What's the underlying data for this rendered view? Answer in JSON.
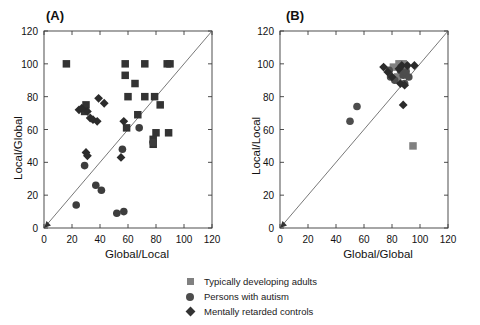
{
  "figure": {
    "width": 480,
    "height": 325,
    "background": "#ffffff"
  },
  "panels": [
    {
      "id": "A",
      "label": "(A)",
      "xlabel": "Global/Local",
      "ylabel": "Local/Global",
      "xlim": [
        0,
        120
      ],
      "ylim": [
        0,
        120
      ],
      "xticks": [
        0,
        20,
        40,
        60,
        80,
        100,
        120
      ],
      "yticks": [
        0,
        20,
        40,
        60,
        80,
        100,
        120
      ],
      "identity_line": true
    },
    {
      "id": "B",
      "label": "(B)",
      "xlabel": "Global/Global",
      "ylabel": "Local/Local",
      "xlim": [
        0,
        120
      ],
      "ylim": [
        0,
        120
      ],
      "xticks": [
        0,
        20,
        40,
        60,
        80,
        100,
        120
      ],
      "yticks": [
        0,
        20,
        40,
        60,
        80,
        100,
        120
      ],
      "identity_line": true
    }
  ],
  "legend": {
    "items": [
      {
        "marker": "square",
        "shape_icon": "square-marker-icon",
        "label": "Typically developing adults",
        "color": "#808080"
      },
      {
        "marker": "circle",
        "shape_icon": "circle-marker-icon",
        "label": "Persons with autism",
        "color": "#4d4d4d"
      },
      {
        "marker": "diamond",
        "shape_icon": "diamond-marker-icon",
        "label": "Mentally retarded controls",
        "color": "#333333"
      }
    ]
  },
  "chart_data": [
    {
      "type": "scatter",
      "panel": "A",
      "title": "(A)",
      "xlabel": "Global/Local",
      "ylabel": "Local/Global",
      "xlim": [
        0,
        120
      ],
      "ylim": [
        0,
        120
      ],
      "xticks": [
        0,
        20,
        40,
        60,
        80,
        100,
        120
      ],
      "yticks": [
        0,
        20,
        40,
        60,
        80,
        100,
        120
      ],
      "grid": false,
      "legend_position": "below-figure",
      "reference_line": {
        "type": "identity",
        "from": [
          0,
          0
        ],
        "to": [
          120,
          120
        ]
      },
      "series": [
        {
          "name": "Typically developing adults",
          "marker": "square",
          "color": "#333333",
          "points": [
            [
              16,
              100
            ],
            [
              30,
              75
            ],
            [
              29,
              71
            ],
            [
              58,
              100
            ],
            [
              58,
              93
            ],
            [
              65,
              88
            ],
            [
              60,
              80
            ],
            [
              72,
              100
            ],
            [
              72,
              80
            ],
            [
              79,
              80
            ],
            [
              67,
              69
            ],
            [
              59,
              61
            ],
            [
              83,
              75
            ],
            [
              88,
              100
            ],
            [
              90,
              100
            ],
            [
              80,
              58
            ],
            [
              89,
              58
            ],
            [
              78,
              54
            ],
            [
              78,
              51
            ]
          ]
        },
        {
          "name": "Persons with autism",
          "marker": "circle",
          "color": "#3d3d3d",
          "points": [
            [
              23,
              14
            ],
            [
              29,
              38
            ],
            [
              37,
              26
            ],
            [
              41,
              23
            ],
            [
              52,
              9
            ],
            [
              57,
              10
            ],
            [
              56,
              48
            ],
            [
              68,
              61
            ],
            [
              78,
              52
            ]
          ]
        },
        {
          "name": "Mentally retarded controls",
          "marker": "diamond",
          "color": "#2b2b2b",
          "points": [
            [
              25,
              72
            ],
            [
              27,
              73
            ],
            [
              31,
              71
            ],
            [
              33,
              67
            ],
            [
              35,
              66
            ],
            [
              38,
              65
            ],
            [
              39,
              79
            ],
            [
              43,
              76
            ],
            [
              30,
              46
            ],
            [
              31,
              44
            ],
            [
              57,
              65
            ],
            [
              55,
              43
            ]
          ]
        }
      ]
    },
    {
      "type": "scatter",
      "panel": "B",
      "title": "(B)",
      "xlabel": "Global/Global",
      "ylabel": "Local/Local",
      "xlim": [
        0,
        120
      ],
      "ylim": [
        0,
        120
      ],
      "xticks": [
        0,
        20,
        40,
        60,
        80,
        100,
        120
      ],
      "yticks": [
        0,
        20,
        40,
        60,
        80,
        100,
        120
      ],
      "grid": false,
      "legend_position": "below-figure",
      "reference_line": {
        "type": "identity",
        "from": [
          0,
          0
        ],
        "to": [
          120,
          120
        ]
      },
      "series": [
        {
          "name": "Typically developing adults",
          "marker": "square",
          "color": "#808080",
          "points": [
            [
              81,
              98
            ],
            [
              85,
              100
            ],
            [
              88,
              100
            ],
            [
              90,
              97
            ],
            [
              87,
              94
            ],
            [
              84,
              92
            ],
            [
              95,
              50
            ]
          ]
        },
        {
          "name": "Persons with autism",
          "marker": "circle",
          "color": "#4d4d4d",
          "points": [
            [
              50,
              65
            ],
            [
              55,
              74
            ],
            [
              78,
              96
            ],
            [
              79,
              92
            ],
            [
              82,
              90
            ],
            [
              86,
              96
            ],
            [
              88,
              93
            ],
            [
              90,
              95
            ],
            [
              92,
              92
            ],
            [
              89,
              88
            ]
          ]
        },
        {
          "name": "Mentally retarded controls",
          "marker": "diamond",
          "color": "#2b2b2b",
          "points": [
            [
              74,
              98
            ],
            [
              77,
              95
            ],
            [
              80,
              92
            ],
            [
              85,
              97
            ],
            [
              87,
              99
            ],
            [
              91,
              99
            ],
            [
              96,
              99
            ],
            [
              86,
              88
            ],
            [
              89,
              87
            ],
            [
              88,
              75
            ]
          ]
        }
      ]
    }
  ]
}
